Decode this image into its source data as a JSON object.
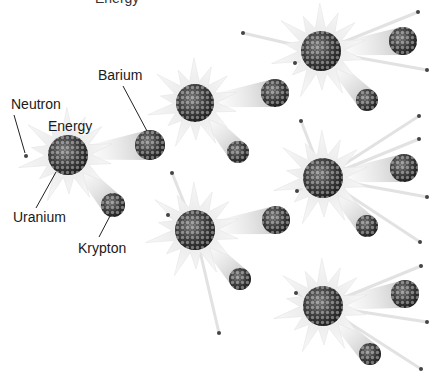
{
  "diagram": {
    "type": "nuclear-fission-chain-reaction",
    "top_clipped_text": "Energy",
    "labels": {
      "neutron": "Neutron",
      "energy": "Energy",
      "barium": "Barium",
      "uranium": "Uranium",
      "krypton": "Krypton"
    },
    "colors": {
      "background": "#ffffff",
      "nucleus_dark": "#2b2b2b",
      "nucleus_light": "#8a8a8a",
      "burst": "#d9d9d9",
      "trail": "#c8c8c8",
      "neutron": "#444444",
      "leader_line": "#222222"
    },
    "generations": [
      {
        "uranium": [
          {
            "x": 68,
            "y": 155,
            "r": 20
          }
        ],
        "barium": [
          {
            "x": 150,
            "y": 145,
            "r": 15
          }
        ],
        "krypton": [
          {
            "x": 113,
            "y": 205,
            "r": 12
          }
        ]
      },
      {
        "uranium": [
          {
            "x": 195,
            "y": 103,
            "r": 19
          },
          {
            "x": 195,
            "y": 230,
            "r": 20
          }
        ],
        "barium": [
          {
            "x": 275,
            "y": 93,
            "r": 14
          },
          {
            "x": 276,
            "y": 220,
            "r": 14
          }
        ],
        "krypton": [
          {
            "x": 238,
            "y": 152,
            "r": 11
          },
          {
            "x": 240,
            "y": 279,
            "r": 11
          }
        ]
      },
      {
        "uranium": [
          {
            "x": 321,
            "y": 51,
            "r": 20
          },
          {
            "x": 323,
            "y": 178,
            "r": 20
          },
          {
            "x": 323,
            "y": 306,
            "r": 20
          }
        ],
        "barium": [
          {
            "x": 403,
            "y": 41,
            "r": 14
          },
          {
            "x": 404,
            "y": 168,
            "r": 14
          },
          {
            "x": 405,
            "y": 294,
            "r": 14
          }
        ],
        "krypton": [
          {
            "x": 367,
            "y": 100,
            "r": 11
          },
          {
            "x": 367,
            "y": 226,
            "r": 11
          },
          {
            "x": 370,
            "y": 354,
            "r": 11
          }
        ]
      }
    ],
    "neutrons": [
      {
        "x": 26,
        "y": 156
      },
      {
        "x": 243,
        "y": 33
      },
      {
        "x": 301,
        "y": 121
      },
      {
        "x": 219,
        "y": 333
      },
      {
        "x": 172,
        "y": 173
      },
      {
        "x": 168,
        "y": 215
      },
      {
        "x": 418,
        "y": 12
      },
      {
        "x": 427,
        "y": 70
      },
      {
        "x": 419,
        "y": 116
      },
      {
        "x": 295,
        "y": 63
      },
      {
        "x": 419,
        "y": 139
      },
      {
        "x": 427,
        "y": 197
      },
      {
        "x": 420,
        "y": 242
      },
      {
        "x": 297,
        "y": 191
      },
      {
        "x": 421,
        "y": 266
      },
      {
        "x": 427,
        "y": 322
      },
      {
        "x": 421,
        "y": 369
      },
      {
        "x": 296,
        "y": 293
      }
    ]
  }
}
